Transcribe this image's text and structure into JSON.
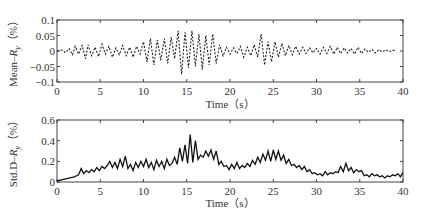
{
  "chart_data": [
    {
      "type": "line",
      "panel": "top",
      "title": "",
      "xlabel": "Time（s）",
      "ylabel": "Mean–R_y（%）",
      "ylabel_parts": {
        "prefix": "Mean–",
        "var": "R",
        "sub": "y",
        "suffix": "（%）"
      },
      "xlim": [
        0,
        40
      ],
      "ylim": [
        -0.1,
        0.1
      ],
      "xticks": [
        0,
        5,
        10,
        15,
        20,
        25,
        30,
        35,
        40
      ],
      "yticks": [
        -0.1,
        -0.05,
        0,
        0.05,
        0.1
      ],
      "ytick_labels": [
        "−0.1",
        "−0.05",
        "0",
        "0.05",
        "0.1"
      ],
      "grid": false,
      "legend": null,
      "series": [
        {
          "name": "Mean-Ry",
          "style": "dashed",
          "x": [
            0,
            0.5,
            1,
            1.4,
            1.8,
            2.1,
            2.5,
            2.9,
            3.3,
            3.6,
            4,
            4.4,
            4.8,
            5.2,
            5.6,
            6,
            6.4,
            6.8,
            7.2,
            7.6,
            8,
            8.4,
            8.8,
            9.2,
            9.6,
            10,
            10.4,
            10.8,
            11.2,
            11.6,
            12,
            12.4,
            12.8,
            13.2,
            13.6,
            14,
            14.4,
            14.8,
            15.2,
            15.6,
            16,
            16.4,
            16.8,
            17.2,
            17.6,
            18,
            18.4,
            18.8,
            19.2,
            19.6,
            20,
            20.4,
            20.8,
            21.2,
            21.6,
            22,
            22.4,
            22.8,
            23.2,
            23.6,
            24,
            24.4,
            24.8,
            25.2,
            25.6,
            26,
            26.4,
            26.8,
            27.2,
            27.6,
            28,
            28.4,
            28.8,
            29.2,
            29.6,
            30,
            30.4,
            30.8,
            31.2,
            31.6,
            32,
            32.4,
            32.8,
            33.2,
            33.6,
            34,
            34.4,
            34.8,
            35.2,
            35.6,
            36,
            36.4,
            36.8,
            37.2,
            37.6,
            38,
            38.4,
            38.8,
            39.2,
            39.6,
            40
          ],
          "y": [
            0,
            0.003,
            -0.005,
            0.008,
            -0.012,
            0.015,
            -0.01,
            0.018,
            -0.025,
            0.02,
            -0.015,
            0.012,
            -0.018,
            0.022,
            -0.01,
            0.015,
            -0.02,
            0.01,
            -0.012,
            0.018,
            -0.015,
            0.012,
            -0.02,
            0.015,
            -0.01,
            0.03,
            -0.035,
            0.04,
            -0.045,
            0.035,
            -0.03,
            0.04,
            -0.04,
            0.045,
            -0.025,
            0.065,
            -0.075,
            0.06,
            -0.055,
            0.065,
            -0.05,
            0.055,
            -0.06,
            0.05,
            -0.045,
            0.055,
            -0.04,
            0.02,
            -0.015,
            0.012,
            -0.01,
            0.01,
            -0.008,
            0.015,
            -0.02,
            0.012,
            -0.015,
            0.02,
            -0.02,
            0.055,
            -0.045,
            0.03,
            -0.035,
            0.03,
            -0.02,
            0.025,
            -0.015,
            0.018,
            -0.012,
            0.015,
            -0.01,
            0.012,
            -0.008,
            0.01,
            -0.006,
            0.008,
            -0.01,
            0.012,
            -0.008,
            0.015,
            -0.01,
            0.012,
            -0.008,
            0.01,
            -0.006,
            0.008,
            -0.01,
            0.012,
            -0.008,
            0.006,
            -0.004,
            0.005,
            -0.006,
            0.004,
            -0.003,
            0.004,
            -0.002,
            0.003,
            0
          ]
        }
      ]
    },
    {
      "type": "line",
      "panel": "bottom",
      "title": "",
      "xlabel": "Time（s）",
      "ylabel": "Std.D–R_y（%）",
      "ylabel_parts": {
        "prefix": "Std.D–",
        "var": "R",
        "sub": "y",
        "suffix": "（%）"
      },
      "xlim": [
        0,
        40
      ],
      "ylim": [
        0,
        0.6
      ],
      "xticks": [
        0,
        5,
        10,
        15,
        20,
        25,
        30,
        35,
        40
      ],
      "yticks": [
        0,
        0.2,
        0.4,
        0.6
      ],
      "ytick_labels": [
        "0",
        "0.2",
        "0.4",
        "0.6"
      ],
      "grid": false,
      "legend": null,
      "series": [
        {
          "name": "Std.D-Ry",
          "style": "solid",
          "x": [
            0,
            0.5,
            1,
            1.5,
            2,
            2.5,
            2.8,
            3.1,
            3.4,
            3.7,
            4,
            4.3,
            4.6,
            4.9,
            5.2,
            5.5,
            5.8,
            6.1,
            6.4,
            6.7,
            7,
            7.3,
            7.6,
            7.9,
            8.2,
            8.5,
            8.8,
            9.1,
            9.4,
            9.7,
            10,
            10.3,
            10.6,
            10.9,
            11.2,
            11.5,
            11.8,
            12.1,
            12.4,
            12.7,
            13,
            13.3,
            13.6,
            13.9,
            14.2,
            14.5,
            14.8,
            15.1,
            15.4,
            15.7,
            16,
            16.3,
            16.6,
            16.9,
            17.2,
            17.5,
            17.8,
            18.1,
            18.4,
            18.7,
            19,
            19.3,
            19.6,
            19.9,
            20.2,
            20.5,
            20.8,
            21.1,
            21.4,
            21.7,
            22,
            22.3,
            22.6,
            22.9,
            23.2,
            23.5,
            23.8,
            24.1,
            24.4,
            24.7,
            25,
            25.3,
            25.6,
            25.9,
            26.2,
            26.5,
            26.8,
            27.1,
            27.4,
            27.7,
            28,
            28.3,
            28.6,
            28.9,
            29.2,
            29.5,
            29.8,
            30.1,
            30.4,
            30.7,
            31,
            31.3,
            31.6,
            31.9,
            32.2,
            32.5,
            32.8,
            33.1,
            33.4,
            33.7,
            34,
            34.3,
            34.6,
            34.9,
            35.2,
            35.5,
            35.8,
            36.1,
            36.4,
            36.7,
            37,
            37.3,
            37.6,
            37.9,
            38.2,
            38.5,
            38.8,
            39.1,
            39.4,
            39.7,
            40
          ],
          "y": [
            0.01,
            0.02,
            0.03,
            0.04,
            0.05,
            0.07,
            0.13,
            0.08,
            0.11,
            0.09,
            0.12,
            0.1,
            0.14,
            0.11,
            0.15,
            0.13,
            0.16,
            0.2,
            0.14,
            0.19,
            0.13,
            0.22,
            0.15,
            0.25,
            0.13,
            0.17,
            0.11,
            0.19,
            0.14,
            0.2,
            0.15,
            0.22,
            0.14,
            0.19,
            0.12,
            0.21,
            0.15,
            0.2,
            0.13,
            0.22,
            0.16,
            0.18,
            0.24,
            0.17,
            0.33,
            0.2,
            0.36,
            0.18,
            0.46,
            0.19,
            0.4,
            0.22,
            0.26,
            0.24,
            0.3,
            0.25,
            0.31,
            0.22,
            0.3,
            0.17,
            0.2,
            0.15,
            0.16,
            0.12,
            0.17,
            0.13,
            0.19,
            0.13,
            0.16,
            0.14,
            0.18,
            0.15,
            0.21,
            0.17,
            0.24,
            0.19,
            0.27,
            0.21,
            0.3,
            0.2,
            0.31,
            0.22,
            0.3,
            0.21,
            0.26,
            0.18,
            0.22,
            0.16,
            0.17,
            0.14,
            0.16,
            0.12,
            0.15,
            0.1,
            0.12,
            0.08,
            0.09,
            0.07,
            0.08,
            0.06,
            0.1,
            0.07,
            0.09,
            0.08,
            0.1,
            0.09,
            0.15,
            0.1,
            0.18,
            0.11,
            0.14,
            0.09,
            0.12,
            0.1,
            0.11,
            0.06,
            0.07,
            0.05,
            0.08,
            0.06,
            0.07,
            0.05,
            0.06,
            0.04,
            0.06,
            0.05,
            0.07,
            0.06,
            0.08,
            0.05,
            0.09
          ]
        }
      ]
    }
  ],
  "panels": {
    "top": {
      "xlabel": "Time（s）",
      "xtick_labels": [
        "0",
        "5",
        "10",
        "15",
        "20",
        "25",
        "30",
        "35",
        "40"
      ],
      "ytick_labels": [
        "0.1",
        "0.05",
        "0",
        "−0.05",
        "−0.1"
      ]
    },
    "bottom": {
      "xlabel": "Time（s）",
      "xtick_labels": [
        "0",
        "5",
        "10",
        "15",
        "20",
        "25",
        "30",
        "35",
        "40"
      ],
      "ytick_labels": [
        "0.6",
        "0.4",
        "0.2",
        "0"
      ]
    }
  }
}
